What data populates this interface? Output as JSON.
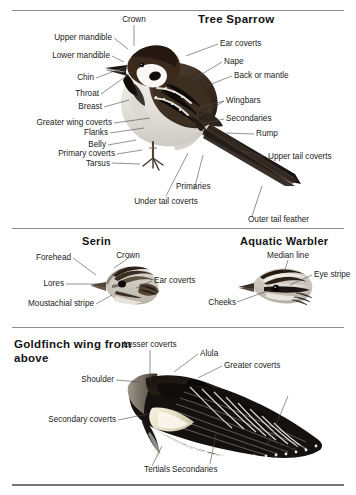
{
  "plate": {
    "width": 356,
    "height": 495,
    "background": "#ffffff",
    "ink": "#1b1b1b",
    "leader_color": "#4a4a4a",
    "rule_color": "#8d8d8d"
  },
  "sections": [
    {
      "id": "tree-sparrow",
      "title": "Tree Sparrow",
      "subject": "perched passerine, side view facing left",
      "labels": [
        {
          "text": "Crown",
          "align": "center"
        },
        {
          "text": "Upper mandible",
          "align": "right"
        },
        {
          "text": "Lower mandible",
          "align": "right"
        },
        {
          "text": "Chin",
          "align": "right"
        },
        {
          "text": "Throat",
          "align": "right"
        },
        {
          "text": "Breast",
          "align": "right"
        },
        {
          "text": "Greater wing coverts",
          "align": "right"
        },
        {
          "text": "Flanks",
          "align": "right"
        },
        {
          "text": "Belly",
          "align": "right"
        },
        {
          "text": "Primary coverts",
          "align": "right"
        },
        {
          "text": "Tarsus",
          "align": "right"
        },
        {
          "text": "Under tail coverts",
          "align": "center"
        },
        {
          "text": "Primaries",
          "align": "left"
        },
        {
          "text": "Ear coverts",
          "align": "left"
        },
        {
          "text": "Nape",
          "align": "left"
        },
        {
          "text": "Back or mantle",
          "align": "left"
        },
        {
          "text": "Wingbars",
          "align": "left"
        },
        {
          "text": "Secondaries",
          "align": "left"
        },
        {
          "text": "Rump",
          "align": "left"
        },
        {
          "text": "Upper tail coverts",
          "align": "left"
        },
        {
          "text": "Outer tail feather",
          "align": "left"
        }
      ]
    },
    {
      "id": "serin",
      "title": "Serin",
      "subject": "head in profile facing left",
      "labels": [
        {
          "text": "Forehead",
          "align": "right"
        },
        {
          "text": "Crown",
          "align": "center"
        },
        {
          "text": "Lores",
          "align": "right"
        },
        {
          "text": "Ear coverts",
          "align": "left"
        },
        {
          "text": "Moustachial stripe",
          "align": "right"
        }
      ]
    },
    {
      "id": "aquatic-warbler",
      "title": "Aquatic Warbler",
      "subject": "head in profile facing left",
      "labels": [
        {
          "text": "Median line",
          "align": "center"
        },
        {
          "text": "Eye stripe",
          "align": "left"
        },
        {
          "text": "Cheeks",
          "align": "right"
        }
      ]
    },
    {
      "id": "goldfinch-wing",
      "title": "Goldfinch wing from above",
      "subject": "spread wing seen from above",
      "labels": [
        {
          "text": "Lesser coverts",
          "align": "center"
        },
        {
          "text": "Alula",
          "align": "left"
        },
        {
          "text": "Greater coverts",
          "align": "left"
        },
        {
          "text": "Shoulder",
          "align": "right"
        },
        {
          "text": "Secondary coverts",
          "align": "right"
        },
        {
          "text": "Primaries",
          "align": "left"
        },
        {
          "text": "Secondaries",
          "align": "left"
        },
        {
          "text": "Tertials",
          "align": "right"
        }
      ]
    }
  ]
}
